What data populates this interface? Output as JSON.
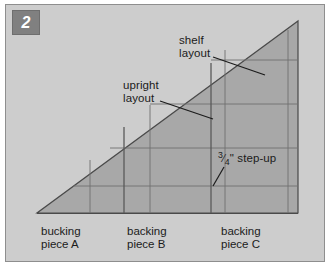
{
  "figure": {
    "number": "2",
    "caption_row": {
      "pieces": [
        {
          "line1": "bucking",
          "line2": "piece A"
        },
        {
          "line1": "backing",
          "line2": "piece B"
        },
        {
          "line1": "backing",
          "line2": "piece C"
        }
      ]
    },
    "annotations": {
      "shelf": {
        "line1": "shelf",
        "line2": "layout"
      },
      "upright": {
        "line1": "upright",
        "line2": "layout"
      },
      "step_up": "3/4\" step-up",
      "step_up_fraction_numerator": "3",
      "step_up_fraction_denominator": "4",
      "step_up_unit": "\"",
      "step_up_text": " step-up"
    },
    "colors": {
      "page_background": "#ffffff",
      "plate_background": "#cdcdcd",
      "triangle_fill": "#a8a8a8",
      "line_color": "#6b6b6b",
      "outline_color": "#4a4a4a",
      "badge_background": "#808080",
      "badge_text": "#ffffff",
      "text": "#1b1b1b"
    },
    "geometry": {
      "triangle_apex": {
        "x": 298,
        "y": 21
      },
      "triangle_bottom_left": {
        "x": 37,
        "y": 213
      },
      "triangle_bottom_right": {
        "x": 298,
        "y": 213
      },
      "baseline_y": 213,
      "vertical_dividers_x": [
        37,
        124,
        211,
        298
      ],
      "upright_lines_x": [
        90,
        124,
        150,
        211
      ],
      "shelf_lines_y": [
        60,
        104,
        148,
        186
      ]
    }
  }
}
